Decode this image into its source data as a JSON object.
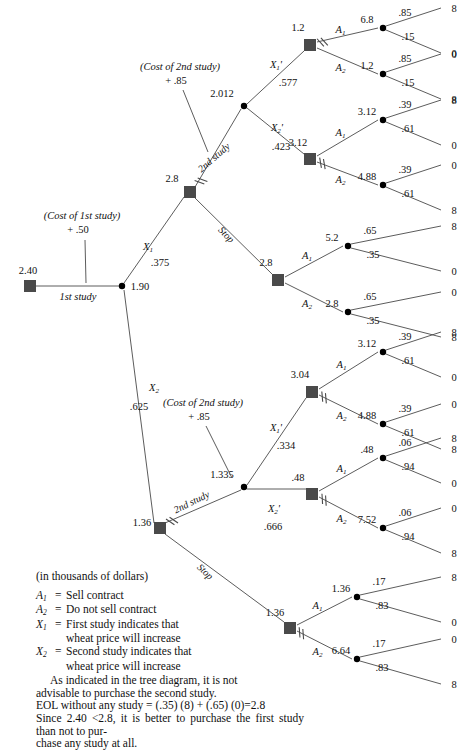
{
  "header": {
    "page_marker": ""
  },
  "diagram": {
    "root": {
      "label": "2.40",
      "x": 30,
      "y": 286
    },
    "first_study_branch": {
      "label": "1st study",
      "cost_note_line1": "(Cost of 1st study)",
      "cost_note_line2": "+ .50"
    },
    "chance_root": {
      "label": "1.90",
      "x": 122,
      "y": 286
    },
    "branches": {
      "x1": {
        "name": "X_1",
        "prob": ".375"
      },
      "x2": {
        "name": "X_2",
        "prob": ".625"
      },
      "x1p": {
        "name": "X_1'",
        "prob_upper": ".577",
        "prob_lower": ".334"
      },
      "x2p": {
        "name": "X_2'",
        "prob_upper": ".423",
        "prob_lower": ".666"
      }
    },
    "second_study_note": {
      "line1": "(Cost of 2nd study)",
      "line2": "+ .85"
    },
    "edge_labels": {
      "second_study": "2nd study",
      "stop": "Stop",
      "a1": "A",
      "a1sub": "1",
      "a2": "A",
      "a2sub": "2"
    },
    "node_values": {
      "upper_decision": "2.8",
      "upper_chance_2nd": "2.012",
      "upper_stop_decision": "2.8",
      "u_x1p_decision": "1.2",
      "u_x2p_decision": "3.12",
      "lower_decision": "1.36",
      "lower_chance_2nd": "1.335",
      "lower_stop_decision": "1.36",
      "l_x1p_decision": "3.04",
      "l_x2p_decision": ".48"
    },
    "outcome_groups": [
      {
        "id": "g1",
        "parent": "1.2",
        "act": "A1",
        "ev": "6.8",
        "p_top": ".85",
        "p_bot": ".15",
        "v_top": "8",
        "v_bot": "0",
        "pruned": true
      },
      {
        "id": "g2",
        "parent": "1.2",
        "act": "A2",
        "ev": "1.2",
        "p_top": ".85",
        "p_bot": ".15",
        "v_top": "0",
        "v_bot": "8",
        "pruned": false
      },
      {
        "id": "g3",
        "parent": "3.12",
        "act": "A1",
        "ev": "3.12",
        "p_top": ".39",
        "p_bot": ".61",
        "v_top": "8",
        "v_bot": "0",
        "pruned": false
      },
      {
        "id": "g4",
        "parent": "3.12",
        "act": "A2",
        "ev": "4.88",
        "p_top": ".39",
        "p_bot": ".61",
        "v_top": "0",
        "v_bot": "8",
        "pruned": true
      },
      {
        "id": "g5",
        "parent": "2.8",
        "act": "A1",
        "ev": "5.2",
        "p_top": ".65",
        "p_bot": ".35",
        "v_top": "8",
        "v_bot": "0",
        "pruned": false
      },
      {
        "id": "g6",
        "parent": "2.8",
        "act": "A2",
        "ev": "2.8",
        "p_top": ".65",
        "p_bot": ".35",
        "v_top": "0",
        "v_bot": "8",
        "pruned": false
      },
      {
        "id": "g7",
        "parent": "3.04",
        "act": "A1",
        "ev": "3.12",
        "p_top": ".39",
        "p_bot": ".61",
        "v_top": "8",
        "v_bot": "0",
        "pruned": false
      },
      {
        "id": "g8",
        "parent": "3.04",
        "act": "A2",
        "ev": "4.88",
        "p_top": ".39",
        "p_bot": ".61",
        "v_top": "0",
        "v_bot": "8",
        "pruned": true
      },
      {
        "id": "g9",
        "parent": ".48",
        "act": "A1",
        "ev": ".48",
        "p_top": ".06",
        "p_bot": ".94",
        "v_top": "8",
        "v_bot": "0",
        "pruned": false
      },
      {
        "id": "g10",
        "parent": ".48",
        "act": "A2",
        "ev": "7.52",
        "p_top": ".06",
        "p_bot": ".94",
        "v_top": "0",
        "v_bot": "8",
        "pruned": true
      },
      {
        "id": "g11",
        "parent": "1.36",
        "act": "A1",
        "ev": "1.36",
        "p_top": ".17",
        "p_bot": ".83",
        "v_top": "8",
        "v_bot": "0",
        "pruned": false
      },
      {
        "id": "g12",
        "parent": "1.36",
        "act": "A2",
        "ev": "6.64",
        "p_top": ".17",
        "p_bot": ".83",
        "v_top": "0",
        "v_bot": "8",
        "pruned": true
      }
    ]
  },
  "legend": {
    "units": "(in thousands of dollars)",
    "definitions": [
      {
        "sym": "A",
        "sub": "1",
        "eq": "=",
        "text": "Sell contract",
        "cont": ""
      },
      {
        "sym": "A",
        "sub": "2",
        "eq": "=",
        "text": "Do not sell contract",
        "cont": ""
      },
      {
        "sym": "X",
        "sub": "1",
        "eq": "=",
        "text": "First study indicates that",
        "cont": "wheat price will increase"
      },
      {
        "sym": "X",
        "sub": "2",
        "eq": "=",
        "text": "Second study indicates that",
        "cont": "wheat price will increase"
      }
    ],
    "notes": [
      "As indicated in the tree diagram, it is not",
      "advisable to purchase the second study.",
      "EOL without any study = (.35) (8) + (.65) (0)=2.8",
      "Since 2.40 <2.8, it is better to purchase the first study than not to pur-",
      "chase any study at all."
    ]
  },
  "colors": {
    "node_fill": "#4a4a4a",
    "line": "#4a4a4a",
    "text": "#111111"
  }
}
